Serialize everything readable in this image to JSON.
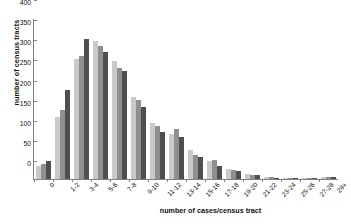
{
  "chart_data": {
    "type": "bar",
    "title": "",
    "xlabel": "number of cases/census tract",
    "ylabel": "number of census tracts",
    "categories": [
      "0",
      "1-2",
      "3-4",
      "5-6",
      "7-8",
      "9-10",
      "11-12",
      "13-14",
      "15-16",
      "17-18",
      "19-20",
      "21-22",
      "23-24",
      "25-26",
      "27-28",
      "29+"
    ],
    "series": [
      {
        "name": "series-1",
        "values": [
          33,
          155,
          297,
          344,
          292,
          205,
          140,
          112,
          73,
          44,
          25,
          13,
          5,
          3,
          2,
          6
        ]
      },
      {
        "name": "series-2",
        "values": [
          38,
          172,
          305,
          331,
          275,
          196,
          131,
          124,
          60,
          47,
          22,
          11,
          4,
          2,
          2,
          6
        ]
      },
      {
        "name": "series-3",
        "values": [
          45,
          221,
          348,
          315,
          268,
          179,
          118,
          105,
          54,
          33,
          20,
          9,
          3,
          2,
          2,
          6
        ]
      }
    ],
    "ylim": [
      0,
      400
    ],
    "yticks": [
      0,
      50,
      100,
      150,
      200,
      250,
      300,
      350,
      400
    ],
    "grid": false,
    "legend": "none",
    "axis_color": "#808080",
    "series_colors": [
      "#c9c9c9",
      "#8f8f8f",
      "#4f4f4f"
    ]
  }
}
